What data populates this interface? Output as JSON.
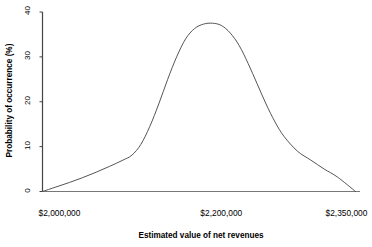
{
  "chart_data": {
    "type": "line",
    "title": "",
    "xlabel": "Estimated value of net revenues",
    "ylabel": "Probability of occurrence (%)",
    "xtick_labels": [
      "$2,000,000",
      "$2,200,000",
      "$2,350,000"
    ],
    "xtick_values": [
      2000000,
      2200000,
      2350000
    ],
    "ytick_labels": [
      "0",
      "10",
      "20",
      "30",
      "40"
    ],
    "ytick_values": [
      0,
      10,
      20,
      30,
      40
    ],
    "xlim": [
      2000000,
      2350000
    ],
    "ylim": [
      0,
      40
    ],
    "grid": false,
    "legend": null,
    "line_color": "#555555",
    "series": [
      {
        "name": "Probability of occurrence",
        "x": [
          2000000,
          2015000,
          2030000,
          2045000,
          2060000,
          2075000,
          2090000,
          2100000,
          2110000,
          2120000,
          2130000,
          2140000,
          2150000,
          2160000,
          2170000,
          2180000,
          2190000,
          2200000,
          2210000,
          2220000,
          2230000,
          2240000,
          2250000,
          2260000,
          2270000,
          2285000,
          2300000,
          2315000,
          2330000,
          2350000
        ],
        "y": [
          0.0,
          1.0,
          2.0,
          3.1,
          4.3,
          5.6,
          7.0,
          8.1,
          10.5,
          14.5,
          19.5,
          25.0,
          30.0,
          34.0,
          36.3,
          37.3,
          37.5,
          37.0,
          35.3,
          32.5,
          28.5,
          24.0,
          19.5,
          15.5,
          12.3,
          9.0,
          7.0,
          5.0,
          3.2,
          0.0
        ]
      }
    ]
  },
  "axes": {
    "y_axis_name": "y-axis-line",
    "x_axis_name": "x-axis-line"
  }
}
